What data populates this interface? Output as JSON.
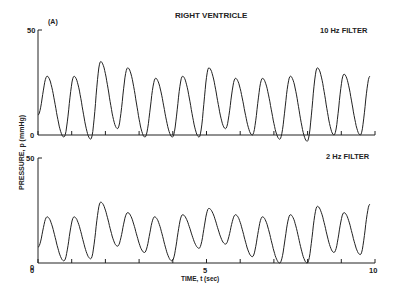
{
  "chart_data": {
    "type": "line",
    "title": "RIGHT VENTRICLE",
    "panel_label": "(A)",
    "xlabel": "TIME, t (sec)",
    "ylabel": "PRESSURE, p (mmHg)",
    "xlim": [
      0,
      10
    ],
    "x_ticks": [
      0,
      5,
      10
    ],
    "grid": false,
    "panels": [
      {
        "name": "10 Hz FILTER",
        "ylim": [
          0,
          50
        ],
        "y_ticks": [
          0,
          50
        ],
        "peaks_t": [
          0.27,
          1.07,
          1.86,
          2.66,
          3.49,
          4.29,
          5.07,
          5.86,
          6.66,
          7.49,
          8.29,
          9.08,
          9.85
        ],
        "peaks_p": [
          28,
          28,
          35,
          32,
          27,
          28,
          32,
          27,
          27,
          28,
          32,
          29,
          28
        ],
        "troughs_p": [
          -1,
          -2,
          3,
          -1,
          -1,
          -1,
          3,
          0,
          -2,
          -3,
          0,
          0
        ]
      },
      {
        "name": "2 Hz FILTER",
        "ylim": [
          0,
          50
        ],
        "y_ticks": [
          0,
          50
        ],
        "peaks_t": [
          0.27,
          1.07,
          1.86,
          2.66,
          3.46,
          4.29,
          5.07,
          5.86,
          6.66,
          7.49,
          8.29,
          9.08,
          9.85
        ],
        "peaks_p": [
          22,
          22,
          29,
          24,
          22,
          23,
          26,
          23,
          22,
          23,
          27,
          24,
          28
        ],
        "troughs_p": [
          1,
          2,
          8,
          5,
          1,
          7,
          9,
          3,
          0,
          0,
          5,
          4
        ]
      }
    ]
  },
  "labels": {
    "title": "RIGHT VENTRICLE",
    "panel": "(A)",
    "top_filter": "10 Hz FILTER",
    "bottom_filter": "2 Hz FILTER",
    "xlabel": "TIME, t (sec)",
    "ylabel": "PRESSURE, p (mmHg)",
    "y50_top": "50",
    "y0_top": "0",
    "y50_bot": "50",
    "y0_bot": "0",
    "x0": "0",
    "x5": "5",
    "x10": "10"
  }
}
